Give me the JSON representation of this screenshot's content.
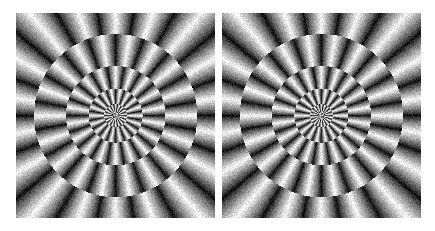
{
  "figure": {
    "background_color": "#ffffff",
    "canvas_width": 435,
    "canvas_height": 231,
    "panel_count": 2
  },
  "palette": {
    "white": "#ffffff",
    "light": "#f2f2f2",
    "mid_light": "#b4b4b4",
    "mid": "#808080",
    "mid_dark": "#4a4a4a",
    "dark": "#141414",
    "black": "#000000",
    "panel_edge": "#d8d8d8"
  },
  "pattern": {
    "ring_count": 9,
    "segments_per_ring": 36,
    "inner_radius_fraction": 0.0,
    "outer_radius_fraction": 1.06,
    "ring_radii_fraction": [
      0.0,
      0.055,
      0.115,
      0.185,
      0.27,
      0.375,
      0.5,
      0.645,
      0.82,
      1.06
    ],
    "gradient_direction": "angular",
    "gradient_low": 8,
    "gradient_high": 250,
    "checker_phase_step_deg": 10,
    "ring_phase_offset_deg": 5,
    "noise_amplitude": 22,
    "noise_grain_px": 1,
    "corner_fill": "extends-to-square-corners"
  },
  "panels": [
    {
      "id": "panel-left",
      "label": "Left illusion panel",
      "x": 16,
      "y": 13,
      "width": 199,
      "height": 205,
      "center_x": 0.5,
      "center_y": 0.5,
      "mirrored": false,
      "rotation_deg": 0,
      "seed": 1337
    },
    {
      "id": "panel-right",
      "label": "Right illusion panel",
      "x": 222,
      "y": 13,
      "width": 199,
      "height": 205,
      "center_x": 0.5,
      "center_y": 0.5,
      "mirrored": true,
      "rotation_deg": 0,
      "seed": 1337
    }
  ]
}
